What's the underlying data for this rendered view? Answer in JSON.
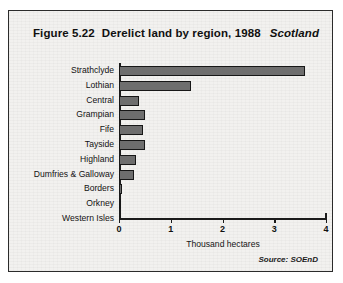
{
  "figure": {
    "figure_number": "Figure 5.22",
    "title": "Derelict land by region, 1988",
    "region": "Scotland",
    "source": "Source: SOEnD"
  },
  "chart_data": {
    "type": "bar",
    "orientation": "horizontal",
    "title": "Derelict land by region, 1988",
    "xlabel": "Thousand hectares",
    "ylabel": "",
    "xlim": [
      0,
      4
    ],
    "xticks": [
      "0",
      "1",
      "2",
      "3",
      "4"
    ],
    "grid": false,
    "legend": false,
    "categories": [
      "Strathclyde",
      "Lothian",
      "Central",
      "Grampian",
      "Fife",
      "Tayside",
      "Highland",
      "Dumfries & Galloway",
      "Borders",
      "Orkney",
      "Western Isles"
    ],
    "values": [
      3.6,
      1.4,
      0.39,
      0.5,
      0.46,
      0.5,
      0.33,
      0.29,
      0.06,
      0.02,
      0.0
    ],
    "bar_color": "#6e6e6e",
    "bar_edge_color": "#171717"
  },
  "axis": {
    "x_label": "Thousand hectares",
    "ticks": [
      {
        "label": "0",
        "value": 0
      },
      {
        "label": "1",
        "value": 1
      },
      {
        "label": "2",
        "value": 2
      },
      {
        "label": "3",
        "value": 3
      },
      {
        "label": "4",
        "value": 4
      }
    ]
  }
}
